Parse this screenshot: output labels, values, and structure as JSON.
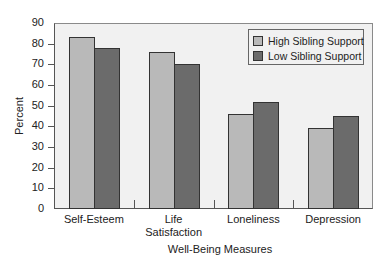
{
  "chart_data": {
    "type": "bar",
    "title": "",
    "xlabel": "Well-Being Measures",
    "ylabel": "Percent",
    "ylim": [
      0,
      90
    ],
    "yticks": [
      0,
      10,
      20,
      30,
      40,
      50,
      60,
      70,
      80,
      90
    ],
    "categories": [
      "Self-Esteem",
      "Life Satisfaction",
      "Loneliness",
      "Depression"
    ],
    "category_lines": [
      [
        "Self-Esteem"
      ],
      [
        "Life",
        "Satisfaction"
      ],
      [
        "Loneliness"
      ],
      [
        "Depression"
      ]
    ],
    "series": [
      {
        "name": "High Sibling Support",
        "values": [
          83,
          76,
          46,
          39
        ],
        "color": "#b9b9b9"
      },
      {
        "name": "Low Sibling Support",
        "values": [
          78,
          70,
          52,
          45
        ],
        "color": "#6b6b6b"
      }
    ],
    "legend_position": "upper right",
    "grid": false
  }
}
